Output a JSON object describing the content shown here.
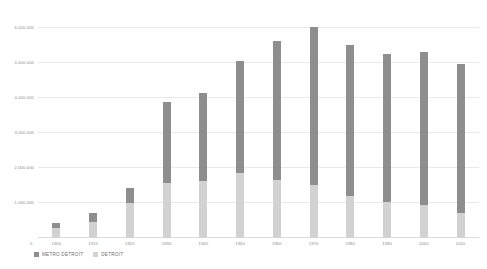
{
  "chart_data": {
    "type": "bar",
    "subtype": "stacked-vertical",
    "title": "",
    "xlabel": "",
    "ylabel": "",
    "categories": [
      "1900",
      "1910",
      "1920",
      "1930",
      "1940",
      "1950",
      "1960",
      "1970",
      "1980",
      "1990",
      "2000",
      "2010"
    ],
    "series": [
      {
        "name": "DETROIT",
        "color": "#d2d2d2",
        "values": [
          285704,
          465766,
          993678,
          1568662,
          1623452,
          1849568,
          1670144,
          1511482,
          1203339,
          1027974,
          951270,
          713777
        ]
      },
      {
        "name": "METRO DETROIT",
        "color": "#8e8e8e",
        "stack_note": "upper segment; total bar height equals metro area population",
        "values": [
          426000,
          725000,
          1426000,
          3900000,
          4140000,
          5060000,
          5650000,
          6030000,
          5520000,
          5280000,
          5340000,
          4980000
        ]
      }
    ],
    "totals": [
      426000,
      725000,
      1426000,
      3900000,
      4140000,
      5060000,
      5650000,
      6030000,
      5520000,
      5280000,
      5340000,
      4980000
    ],
    "ylim": [
      0,
      6300000
    ],
    "yticks": [
      0,
      1000000,
      2000000,
      3000000,
      4000000,
      5000000,
      6000000
    ],
    "ytick_labels": [
      "0",
      "1,000,000",
      "2,000,000",
      "3,000,000",
      "4,000,000",
      "5,000,000",
      "6,000,000"
    ],
    "grid": true,
    "legend_position": "bottom-left"
  },
  "legend": {
    "items": [
      {
        "label": "METRO DETROIT",
        "color": "#8e8e8e",
        "icon": "square-swatch"
      },
      {
        "label": "DETROIT",
        "color": "#d2d2d2",
        "icon": "square-swatch"
      }
    ]
  },
  "colors": {
    "metro": "#8e8e8e",
    "city": "#d2d2d2",
    "grid": "#e9e9e9",
    "axis_text": "#8d8d8d",
    "legend_text": "#6f6f6f",
    "background": "#ffffff"
  }
}
